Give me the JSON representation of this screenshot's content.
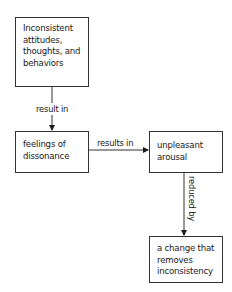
{
  "diagram": {
    "nodes": [
      {
        "id": "n1",
        "lines": [
          "Inconsistent",
          "attitudes,",
          "thoughts, and",
          "behaviors"
        ]
      },
      {
        "id": "n2",
        "lines": [
          "feelings of",
          "dissonance"
        ]
      },
      {
        "id": "n3",
        "lines": [
          "unpleasant",
          "arousal"
        ]
      },
      {
        "id": "n4",
        "lines": [
          "a change that",
          "removes",
          "inconsistency"
        ]
      }
    ],
    "edges": [
      {
        "from": "n1",
        "to": "n2",
        "label": "result in"
      },
      {
        "from": "n2",
        "to": "n3",
        "label": "results in"
      },
      {
        "from": "n3",
        "to": "n4",
        "label": "reduced by"
      }
    ]
  }
}
